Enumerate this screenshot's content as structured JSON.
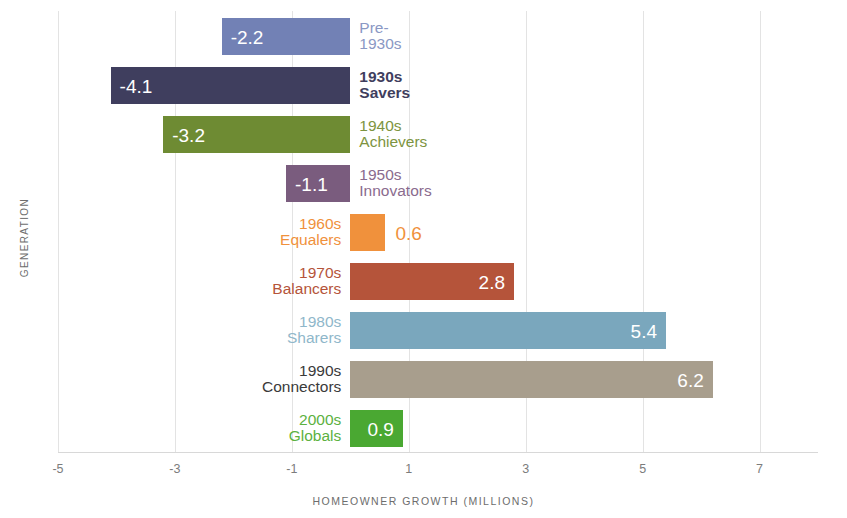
{
  "chart_data": {
    "type": "bar",
    "orientation": "horizontal",
    "title": "",
    "xlabel": "HOMEOWNER GROWTH (MILLIONS)",
    "ylabel": "GENERATION",
    "xlim": [
      -5,
      8
    ],
    "xticks": [
      -5,
      -3,
      -1,
      1,
      3,
      5,
      7
    ],
    "xtick_labels": [
      "-5",
      "-3",
      "-1",
      "1",
      "3",
      "5",
      "7"
    ],
    "grid": true,
    "grid_axis": "x",
    "legend": "none",
    "categories": [
      "Pre-1930s",
      "1930s Savers",
      "1940s Achievers",
      "1950s Innovators",
      "1960s Equalers",
      "1970s Balancers",
      "1980s Sharers",
      "1990s Connectors",
      "2000s Globals"
    ],
    "values": [
      -2.2,
      -4.1,
      -3.2,
      -1.1,
      0.6,
      2.8,
      5.4,
      6.2,
      0.9
    ],
    "value_labels": [
      "-2.2",
      "-4.1",
      "-3.2",
      "-1.1",
      "0.6",
      "2.8",
      "5.4",
      "6.2",
      "0.9"
    ],
    "colors": [
      "#7281b5",
      "#3f3e5e",
      "#6e8b33",
      "#7a5c7e",
      "#f0913c",
      "#b5543a",
      "#7aa7bd",
      "#a89e8d",
      "#4aa832"
    ],
    "bars": [
      {
        "category_line1": "Pre-",
        "category_line2": "1930s",
        "value": -2.2,
        "value_label": "-2.2",
        "color": "#7281b5",
        "label_color": "#8a98c4",
        "value_color": "#ffffff",
        "label_weight": "400"
      },
      {
        "category_line1": "1930s",
        "category_line2": "Savers",
        "value": -4.1,
        "value_label": "-4.1",
        "color": "#3f3e5e",
        "label_color": "#3f3e5e",
        "value_color": "#ffffff",
        "label_weight": "700"
      },
      {
        "category_line1": "1940s",
        "category_line2": "Achievers",
        "value": -3.2,
        "value_label": "-3.2",
        "color": "#6e8b33",
        "label_color": "#7d9440",
        "value_color": "#ffffff",
        "label_weight": "400"
      },
      {
        "category_line1": "1950s",
        "category_line2": "Innovators",
        "value": -1.1,
        "value_label": "-1.1",
        "color": "#7a5c7e",
        "label_color": "#8a6b8e",
        "value_color": "#ffffff",
        "label_weight": "400"
      },
      {
        "category_line1": "1960s",
        "category_line2": "Equalers",
        "value": 0.6,
        "value_label": "0.6",
        "color": "#f0913c",
        "label_color": "#f0913c",
        "value_color": "#f0913c",
        "label_weight": "400"
      },
      {
        "category_line1": "1970s",
        "category_line2": "Balancers",
        "value": 2.8,
        "value_label": "2.8",
        "color": "#b5543a",
        "label_color": "#b5543a",
        "value_color": "#ffffff",
        "label_weight": "400"
      },
      {
        "category_line1": "1980s",
        "category_line2": "Sharers",
        "value": 5.4,
        "value_label": "5.4",
        "color": "#7aa7bd",
        "label_color": "#8fb7ca",
        "value_color": "#ffffff",
        "label_weight": "400"
      },
      {
        "category_line1": "1990s",
        "category_line2": "Connectors",
        "value": 6.2,
        "value_label": "6.2",
        "color": "#a89e8d",
        "label_color": "#3a3a3a",
        "value_color": "#ffffff",
        "label_weight": "400"
      },
      {
        "category_line1": "2000s",
        "category_line2": "Globals",
        "value": 0.9,
        "value_label": "0.9",
        "color": "#4aa832",
        "label_color": "#5cb13f",
        "value_color": "#ffffff",
        "label_weight": "400"
      }
    ]
  }
}
